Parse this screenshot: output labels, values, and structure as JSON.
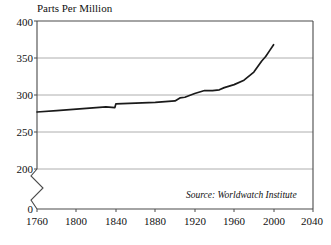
{
  "chart": {
    "title": "Parts Per Million",
    "source_note": "Source: Worldwatch Institute",
    "axis_break": true
  },
  "chart_data": {
    "type": "line",
    "title": "Parts Per Million",
    "subtitle": "",
    "xlabel": "",
    "ylabel": "Parts Per Million",
    "xlim": [
      1760,
      2040
    ],
    "ylim": [
      200,
      400
    ],
    "y_axis_break": {
      "from": 0,
      "to": 200,
      "style": "zigzag"
    },
    "xticks": [
      1760,
      1800,
      1840,
      1880,
      1920,
      1960,
      2000,
      2040
    ],
    "yticks": [
      0,
      200,
      250,
      300,
      350,
      400
    ],
    "grid": "horizontal",
    "legend": null,
    "annotations": [
      {
        "text": "Source: Worldwatch Institute",
        "position": "bottom-right",
        "style": "italic"
      }
    ],
    "series": [
      {
        "name": "Atmospheric CO2 Concentration",
        "color": "#1a1a1a",
        "x": [
          1760,
          1780,
          1800,
          1820,
          1830,
          1839,
          1840,
          1860,
          1880,
          1900,
          1905,
          1910,
          1920,
          1930,
          1938,
          1945,
          1950,
          1960,
          1970,
          1980,
          1988,
          1992,
          1996,
          2000
        ],
        "values": [
          277,
          279,
          281,
          283,
          284,
          283,
          288,
          289,
          290,
          292,
          296,
          297,
          302,
          306,
          306,
          307,
          310,
          314,
          320,
          331,
          346,
          352,
          360,
          368
        ]
      }
    ]
  },
  "ytick_labels": [
    "400",
    "350",
    "300",
    "250",
    "200",
    "0"
  ],
  "xtick_labels": [
    "1760",
    "1800",
    "1840",
    "1880",
    "1920",
    "1960",
    "2000",
    "2040"
  ]
}
